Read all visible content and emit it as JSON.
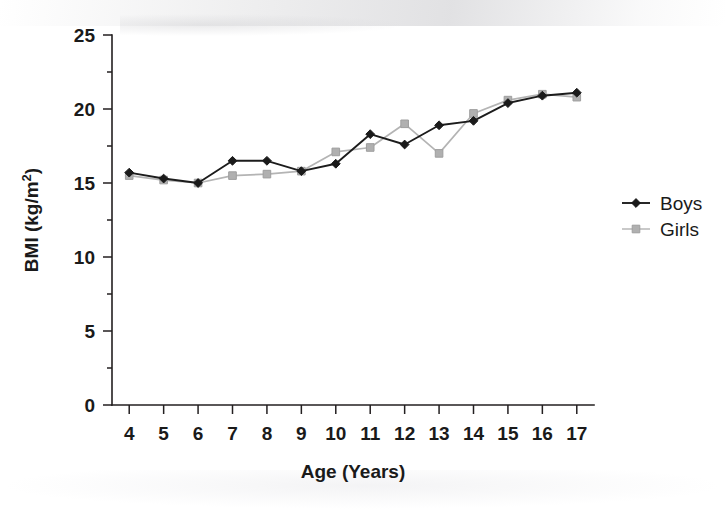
{
  "chart_data": {
    "type": "line",
    "title": "",
    "subtitle": "",
    "xlabel": "Age (Years)",
    "ylabel": "BMI (kg/m",
    "ylabel_sup": "2",
    "ylabel_suffix": ")",
    "ylabel_full": "BMI (kg/m2)",
    "x": [
      4,
      5,
      6,
      7,
      8,
      9,
      10,
      11,
      12,
      13,
      14,
      15,
      16,
      17
    ],
    "categories": [
      "4",
      "5",
      "6",
      "7",
      "8",
      "9",
      "10",
      "11",
      "12",
      "13",
      "14",
      "15",
      "16",
      "17"
    ],
    "xtick_labels": [
      "4",
      "5",
      "6",
      "7",
      "8",
      "9",
      "10",
      "11",
      "12",
      "13",
      "14",
      "15",
      "16",
      "17"
    ],
    "ytick_labels": [
      "0",
      "5",
      "10",
      "15",
      "20",
      "25"
    ],
    "yticks": [
      0,
      5,
      10,
      15,
      20,
      25
    ],
    "xlim": [
      3.5,
      17.5
    ],
    "ylim": [
      0,
      25
    ],
    "grid": false,
    "legend_position": "right",
    "series": [
      {
        "name": "Boys",
        "marker": "diamond",
        "color": "#1a1a1a",
        "values": [
          15.7,
          15.3,
          15.0,
          16.5,
          16.5,
          15.8,
          16.3,
          18.3,
          17.6,
          18.9,
          19.2,
          20.4,
          20.9,
          21.1
        ]
      },
      {
        "name": "Girls",
        "marker": "square",
        "color": "#b0b0b0",
        "values": [
          15.5,
          15.2,
          15.0,
          15.5,
          15.6,
          15.8,
          17.1,
          17.4,
          19.0,
          17.0,
          19.7,
          20.6,
          21.0,
          20.8
        ]
      }
    ]
  },
  "legend": {
    "items": [
      {
        "label": "Boys",
        "marker": "diamond",
        "color": "#1a1a1a"
      },
      {
        "label": "Girls",
        "marker": "square",
        "color": "#b0b0b0"
      }
    ]
  },
  "colors": {
    "boys": "#1a1a1a",
    "girls": "#b0b0b0",
    "axis": "#231f20",
    "background": "#ffffff"
  }
}
